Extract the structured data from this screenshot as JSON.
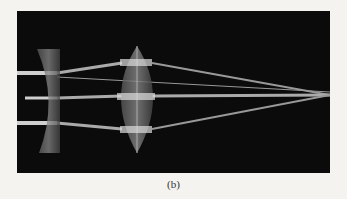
{
  "figure": {
    "caption": "(b)",
    "colors": {
      "background": "#0b0b0b",
      "page": "#f4f3f0",
      "ray": "#d8d8d8"
    }
  }
}
